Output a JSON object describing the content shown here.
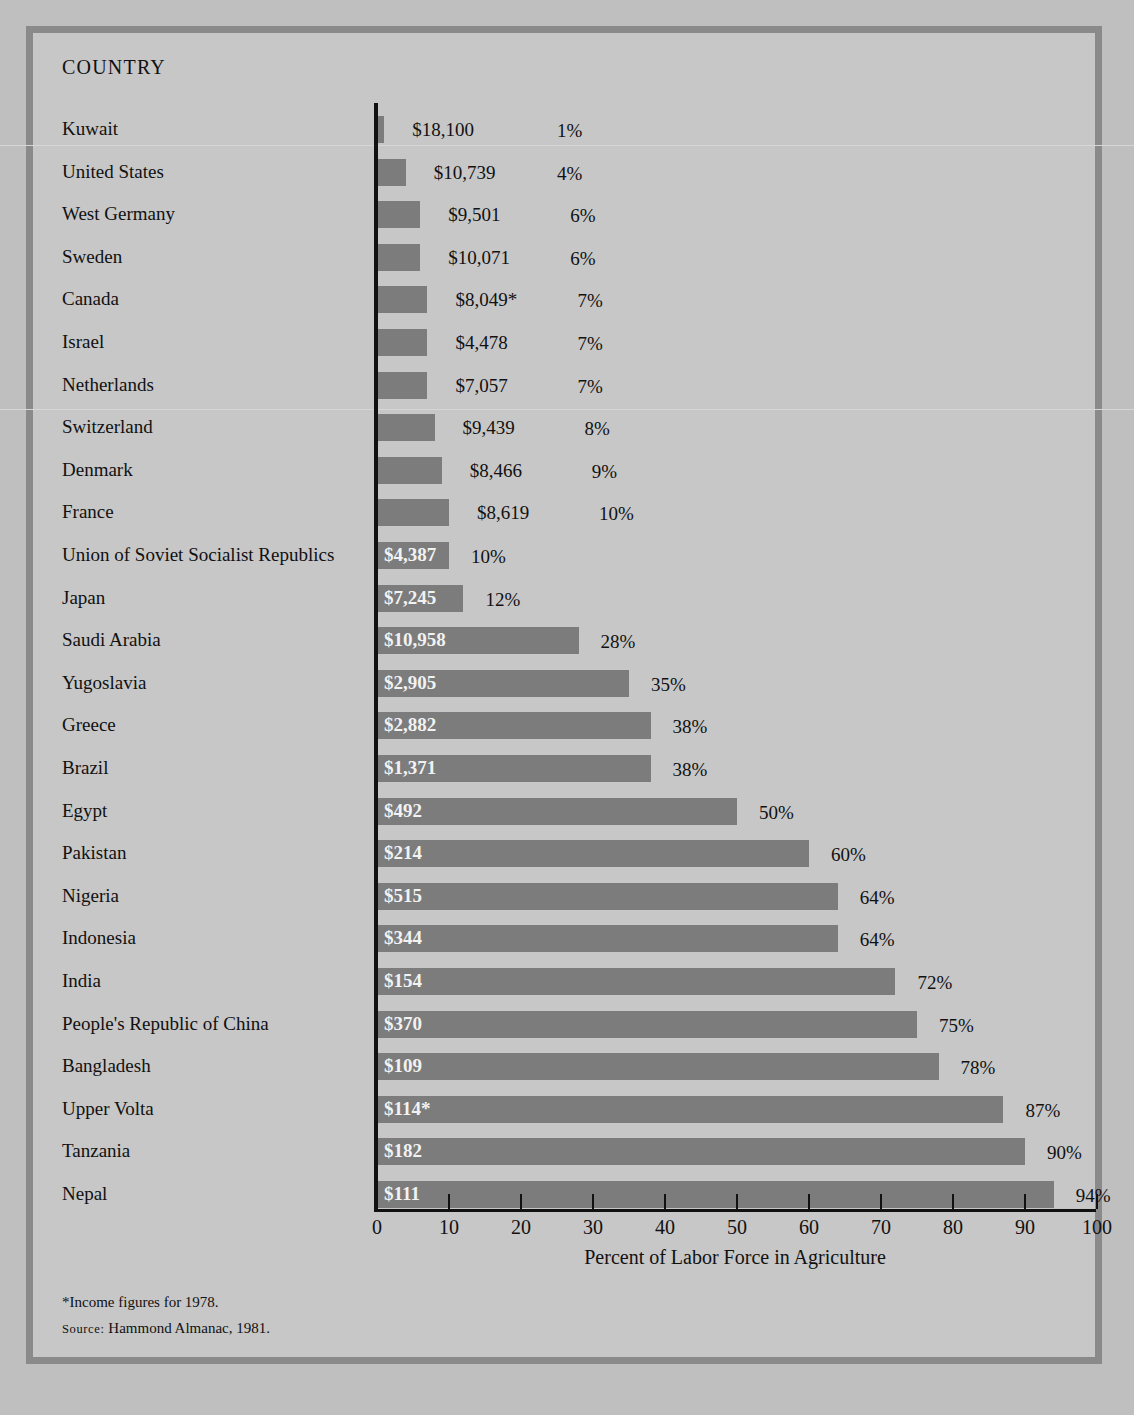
{
  "header": {
    "column_title": "COUNTRY"
  },
  "chart_data": {
    "type": "bar",
    "orientation": "horizontal",
    "title": "",
    "xlabel": "Percent of Labor Force in Agriculture",
    "ylabel": "COUNTRY",
    "xlim": [
      0,
      100
    ],
    "xticks": [
      0,
      10,
      20,
      30,
      40,
      50,
      60,
      70,
      80,
      90,
      100
    ],
    "grid": false,
    "legend": null,
    "bar_color": "#7c7c7c",
    "background_color": "#c7c7c7",
    "categories": [
      "Kuwait",
      "United States",
      "West Germany",
      "Sweden",
      "Canada",
      "Israel",
      "Netherlands",
      "Switzerland",
      "Denmark",
      "France",
      "Union of Soviet Socialist Republics",
      "Japan",
      "Saudi Arabia",
      "Yugoslavia",
      "Greece",
      "Brazil",
      "Egypt",
      "Pakistan",
      "Nigeria",
      "Indonesia",
      "India",
      "People's Republic of China",
      "Bangladesh",
      "Upper Volta",
      "Tanzania",
      "Nepal"
    ],
    "values": [
      1,
      4,
      6,
      6,
      7,
      7,
      7,
      8,
      9,
      10,
      10,
      12,
      28,
      35,
      38,
      38,
      50,
      60,
      64,
      64,
      72,
      75,
      78,
      87,
      90,
      94
    ],
    "annotations": {
      "label": "Per capita income",
      "values": [
        "$18,100",
        "$10,739",
        "$9,501",
        "$10,071",
        "$8,049*",
        "$4,478",
        "$7,057",
        "$9,439",
        "$8,466",
        "$8,619",
        "$4,387",
        "$7,245",
        "$10,958",
        "$2,905",
        "$2,882",
        "$1,371",
        "$492",
        "$214",
        "$515",
        "$344",
        "$154",
        "$370",
        "$109",
        "$114*",
        "$182",
        "$111"
      ]
    },
    "percent_labels": [
      "1%",
      "4%",
      "6%",
      "6%",
      "7%",
      "7%",
      "7%",
      "8%",
      "9%",
      "10%",
      "10%",
      "12%",
      "28%",
      "35%",
      "38%",
      "38%",
      "50%",
      "60%",
      "64%",
      "64%",
      "72%",
      "75%",
      "78%",
      "87%",
      "90%",
      "94%"
    ]
  },
  "rows": [
    {
      "country": "Kuwait",
      "income": "$18,100",
      "percent": "1%",
      "value": 1,
      "inside": false
    },
    {
      "country": "United States",
      "income": "$10,739",
      "percent": "4%",
      "value": 4,
      "inside": false
    },
    {
      "country": "West Germany",
      "income": "$9,501",
      "percent": "6%",
      "value": 6,
      "inside": false
    },
    {
      "country": "Sweden",
      "income": "$10,071",
      "percent": "6%",
      "value": 6,
      "inside": false
    },
    {
      "country": "Canada",
      "income": "$8,049*",
      "percent": "7%",
      "value": 7,
      "inside": false
    },
    {
      "country": "Israel",
      "income": "$4,478",
      "percent": "7%",
      "value": 7,
      "inside": false
    },
    {
      "country": "Netherlands",
      "income": "$7,057",
      "percent": "7%",
      "value": 7,
      "inside": false
    },
    {
      "country": "Switzerland",
      "income": "$9,439",
      "percent": "8%",
      "value": 8,
      "inside": false
    },
    {
      "country": "Denmark",
      "income": "$8,466",
      "percent": "9%",
      "value": 9,
      "inside": false
    },
    {
      "country": "France",
      "income": "$8,619",
      "percent": "10%",
      "value": 10,
      "inside": false
    },
    {
      "country": "Union of Soviet Socialist Republics",
      "income": "$4,387",
      "percent": "10%",
      "value": 10,
      "inside": true
    },
    {
      "country": "Japan",
      "income": "$7,245",
      "percent": "12%",
      "value": 12,
      "inside": true
    },
    {
      "country": "Saudi Arabia",
      "income": "$10,958",
      "percent": "28%",
      "value": 28,
      "inside": true
    },
    {
      "country": "Yugoslavia",
      "income": "$2,905",
      "percent": "35%",
      "value": 35,
      "inside": true
    },
    {
      "country": "Greece",
      "income": "$2,882",
      "percent": "38%",
      "value": 38,
      "inside": true
    },
    {
      "country": "Brazil",
      "income": "$1,371",
      "percent": "38%",
      "value": 38,
      "inside": true
    },
    {
      "country": "Egypt",
      "income": "$492",
      "percent": "50%",
      "value": 50,
      "inside": true
    },
    {
      "country": "Pakistan",
      "income": "$214",
      "percent": "60%",
      "value": 60,
      "inside": true
    },
    {
      "country": "Nigeria",
      "income": "$515",
      "percent": "64%",
      "value": 64,
      "inside": true
    },
    {
      "country": "Indonesia",
      "income": "$344",
      "percent": "64%",
      "value": 64,
      "inside": true
    },
    {
      "country": "India",
      "income": "$154",
      "percent": "72%",
      "value": 72,
      "inside": true
    },
    {
      "country": "People's Republic of China",
      "income": "$370",
      "percent": "75%",
      "value": 75,
      "inside": true
    },
    {
      "country": "Bangladesh",
      "income": "$109",
      "percent": "78%",
      "value": 78,
      "inside": true
    },
    {
      "country": "Upper Volta",
      "income": "$114*",
      "percent": "87%",
      "value": 87,
      "inside": true
    },
    {
      "country": "Tanzania",
      "income": "$182",
      "percent": "90%",
      "value": 90,
      "inside": true
    },
    {
      "country": "Nepal",
      "income": "$111",
      "percent": "94%",
      "value": 94,
      "inside": true
    }
  ],
  "axis": {
    "ticks": [
      "0",
      "10",
      "20",
      "30",
      "40",
      "50",
      "60",
      "70",
      "80",
      "90",
      "100"
    ],
    "title": "Percent of Labor Force in Agriculture"
  },
  "footnotes": {
    "asterisk_note": "*Income figures for 1978.",
    "source_word": "Source:",
    "source_text": "Hammond Almanac, 1981."
  }
}
